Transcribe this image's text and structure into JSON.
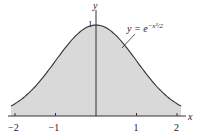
{
  "chart_data": {
    "type": "area",
    "title": "",
    "function_label": "y = e^{-x^2/2}",
    "function_label_parts": {
      "lhs": "y = e",
      "exp": "−x²/2"
    },
    "xlabel": "x",
    "ylabel": "y",
    "xlim": [
      -2.1,
      2.1
    ],
    "ylim": [
      0,
      1.1
    ],
    "x_ticks": [
      "−2",
      "−1",
      "1",
      "2"
    ],
    "x_tick_values": [
      -2,
      -1,
      1,
      2
    ],
    "y_ticks": [
      "1"
    ],
    "y_tick_values": [
      1
    ],
    "shaded": true,
    "fill_color": "#d9d9d9",
    "line_color": "#333333",
    "series": [
      {
        "name": "e^{-x^2/2}",
        "x": [
          -2.1,
          -2,
          -1.5,
          -1,
          -0.5,
          0,
          0.5,
          1,
          1.5,
          2,
          2.1
        ],
        "values": [
          0.11,
          0.135,
          0.325,
          0.607,
          0.882,
          1.0,
          0.882,
          0.607,
          0.325,
          0.135,
          0.11
        ]
      }
    ]
  }
}
